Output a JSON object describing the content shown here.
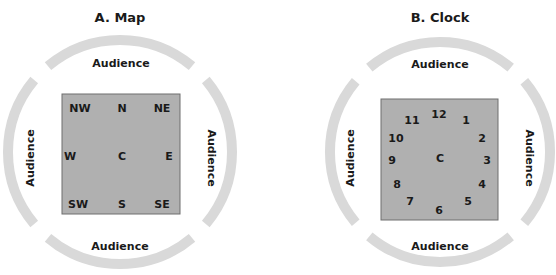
{
  "colors": {
    "background": "#ffffff",
    "arc": "#d9d9d9",
    "square_fill": "#b0b0b0",
    "square_border": "#6e6e6e",
    "text": "#1a1a1a"
  },
  "panels": [
    {
      "title": "A.  Map",
      "audience": {
        "top": "Audience",
        "bottom": "Audience",
        "left": "Audience",
        "right": "Audience"
      },
      "grid": {
        "nw": "NW",
        "n": "N",
        "ne": "NE",
        "w": "W",
        "c": "C",
        "e": "E",
        "sw": "SW",
        "s": "S",
        "se": "SE"
      }
    },
    {
      "title": "B.  Clock",
      "audience": {
        "top": "Audience",
        "bottom": "Audience",
        "left": "Audience",
        "right": "Audience"
      },
      "center": "C",
      "hours": [
        "12",
        "1",
        "2",
        "3",
        "4",
        "5",
        "6",
        "7",
        "8",
        "9",
        "10",
        "11"
      ]
    }
  ]
}
